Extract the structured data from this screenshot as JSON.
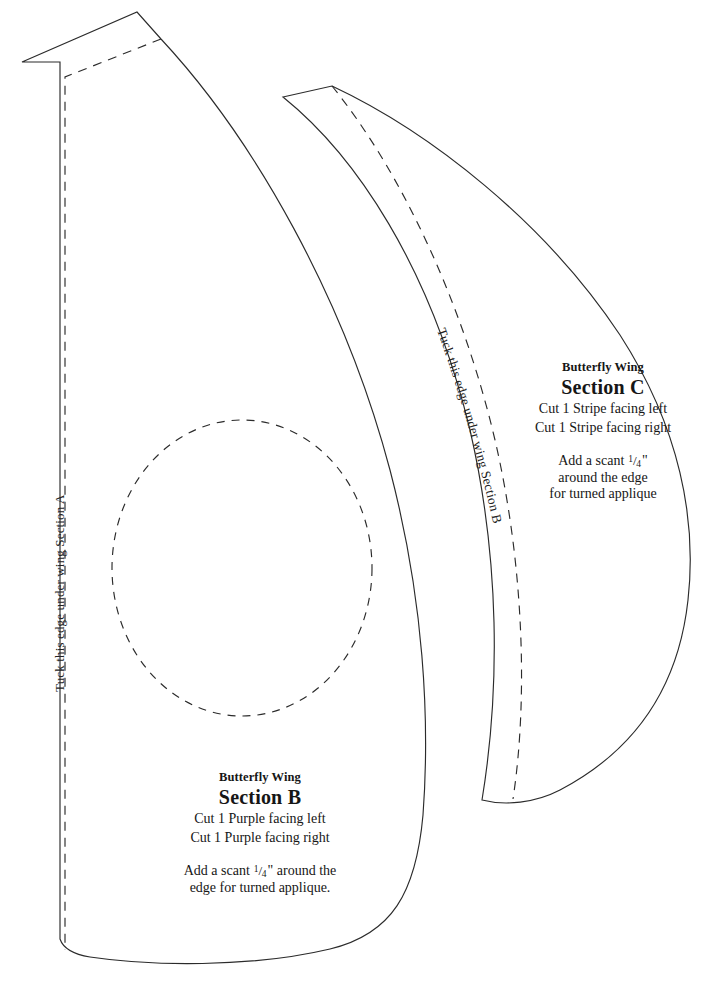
{
  "document": {
    "kind": "quilting-applique-pattern-sheet",
    "background_color": "#ffffff",
    "line_color": "#2b2b2b"
  },
  "section_b": {
    "kicker": "Butterfly Wing",
    "section_label": "Section B",
    "cut_lines": [
      "Cut 1 Purple facing left",
      "Cut 1 Purple facing right"
    ],
    "note_lines": [
      "Add a scant 1/4\" around the",
      "edge for turned applique."
    ],
    "note_line_1_prefix": "Add a scant ",
    "note_line_1_suffix": "\" around the",
    "note_line_2": "edge for turned applique.",
    "fraction_numerator": "1",
    "fraction_slash": "/",
    "fraction_denominator": "4",
    "tuck_label": "Tuck this edge under wing Section A"
  },
  "section_c": {
    "kicker": "Butterfly Wing",
    "section_label": "Section C",
    "cut_lines": [
      "Cut 1 Stripe facing left",
      "Cut 1 Stripe facing right"
    ],
    "note_lines": [
      "Add a scant 1/4\"",
      "around the edge",
      "for turned applique"
    ],
    "note_line_1_prefix": "Add a scant ",
    "note_line_1_suffix": "\"",
    "note_line_2": "around the edge",
    "note_line_3": "for turned applique",
    "fraction_numerator": "1",
    "fraction_slash": "/",
    "fraction_denominator": "4",
    "tuck_label": "Tuck this edge under wing Section B"
  },
  "credit": {
    "text": ""
  }
}
